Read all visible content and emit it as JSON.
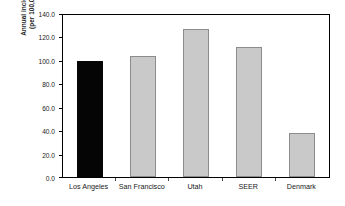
{
  "chart_data": {
    "type": "bar",
    "title": "",
    "xlabel": "",
    "ylabel": "Annual incidence (per 100,000)",
    "ylabel_line1": "Annual incidence",
    "ylabel_line2": "(per 100,000)",
    "categories": [
      "Los Angeles",
      "San Francisco",
      "Utah",
      "SEER",
      "Denmark"
    ],
    "values": [
      100.0,
      105.0,
      128.0,
      112.0,
      38.0
    ],
    "ylim": [
      0.0,
      140.0
    ],
    "ytick_values": [
      0.0,
      20.0,
      40.0,
      60.0,
      80.0,
      100.0,
      120.0,
      140.0
    ],
    "ytick_labels": [
      "0.0",
      "20.0",
      "40.0",
      "60.0",
      "80.0",
      "100.0",
      "120.0",
      "140.0"
    ],
    "grid": false,
    "legend": "none",
    "bar_colors": [
      "#050505",
      "#c9c9c9",
      "#c9c9c9",
      "#c9c9c9",
      "#c9c9c9"
    ],
    "bar_border_colors": [
      "#050505",
      "#8c8c8c",
      "#8c8c8c",
      "#8c8c8c",
      "#8c8c8c"
    ],
    "highlight_category": "Los Angeles",
    "axis_color": "#000000",
    "background_color": "#ffffff"
  }
}
